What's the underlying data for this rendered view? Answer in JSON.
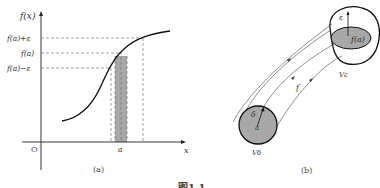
{
  "panel_a": {
    "y_axis_label": "f(x)",
    "x_axis_label": "x",
    "origin_label": "O",
    "tick_a": "a",
    "y_ticks": [
      "f(a)+ε",
      "f(a)",
      "f(a)−ε"
    ],
    "caption": "(a)"
  },
  "panel_b": {
    "image_center_label": "f(a)",
    "epsilon_label": "ε",
    "mapping_label": "f",
    "delta_label": "δ",
    "domain_center_label": "a",
    "neighborhood_image_label": "Vε",
    "neighborhood_domain_label": "Vδ",
    "caption": "(b)"
  },
  "figure_caption": "图1.1",
  "colors": {
    "line": "#111111",
    "dashed": "#666666",
    "shade": "#a8a8a8",
    "text": "#333333"
  }
}
